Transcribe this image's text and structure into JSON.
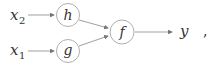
{
  "diagram": {
    "type": "computation-graph",
    "inputs": [
      {
        "id": "x2",
        "base": "x",
        "subscript": "2"
      },
      {
        "id": "x1",
        "base": "x",
        "subscript": "1"
      }
    ],
    "nodes": [
      {
        "id": "h",
        "label": "h"
      },
      {
        "id": "g",
        "label": "g"
      },
      {
        "id": "f",
        "label": "f"
      }
    ],
    "output": {
      "label": "y"
    },
    "trailing_punctuation": ",",
    "edges": [
      {
        "from": "x2",
        "to": "h"
      },
      {
        "from": "x1",
        "to": "g"
      },
      {
        "from": "h",
        "to": "f"
      },
      {
        "from": "g",
        "to": "f"
      },
      {
        "from": "f",
        "to": "y"
      }
    ],
    "colors": {
      "stroke": "#8a8a8a",
      "text": "#333333"
    }
  }
}
